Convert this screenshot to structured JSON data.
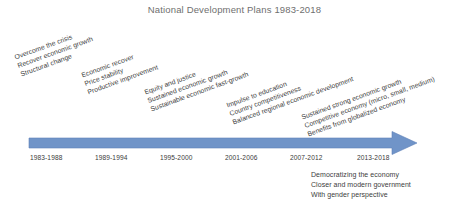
{
  "title": "National Development Plans 1983-2018",
  "colors": {
    "arrow": "#7094c8",
    "arrow_edge": "#5f82b8",
    "title_text": "#6f6f6f",
    "body_text": "#404040",
    "background": "#ffffff"
  },
  "timeline": {
    "axis_label": "",
    "periods": [
      {
        "label": "1983-1988"
      },
      {
        "label": "1989-1994"
      },
      {
        "label": "1995-2000"
      },
      {
        "label": "2001-2006"
      },
      {
        "label": "2007-2012"
      },
      {
        "label": "2013-2018"
      }
    ]
  },
  "plan_groups": [
    {
      "period": "1983-1988",
      "lines": [
        "Overcome the crisis",
        "Recover economic growth",
        "Structural change"
      ]
    },
    {
      "period": "1989-1994",
      "lines": [
        "Economic recover",
        "Price stability",
        "Productive improvement"
      ]
    },
    {
      "period": "1995-2000",
      "lines": [
        "Equity and justice",
        "Sustained economic growth",
        "Sustainable economic fast-growth"
      ]
    },
    {
      "period": "2001-2006",
      "lines": [
        "Impulse to education",
        "Country competitiveness",
        "Balanced regional economic development"
      ]
    },
    {
      "period": "2013-2018",
      "lines": [
        "Sustained strong economic growth",
        "Competitive economy (micro, small, medium)",
        "Benefits from globalized economy"
      ]
    }
  ],
  "note_block": {
    "period": "2013-2018",
    "lines": [
      "Democratizing the economy",
      "Closer and modern government",
      "With gender perspective"
    ]
  }
}
